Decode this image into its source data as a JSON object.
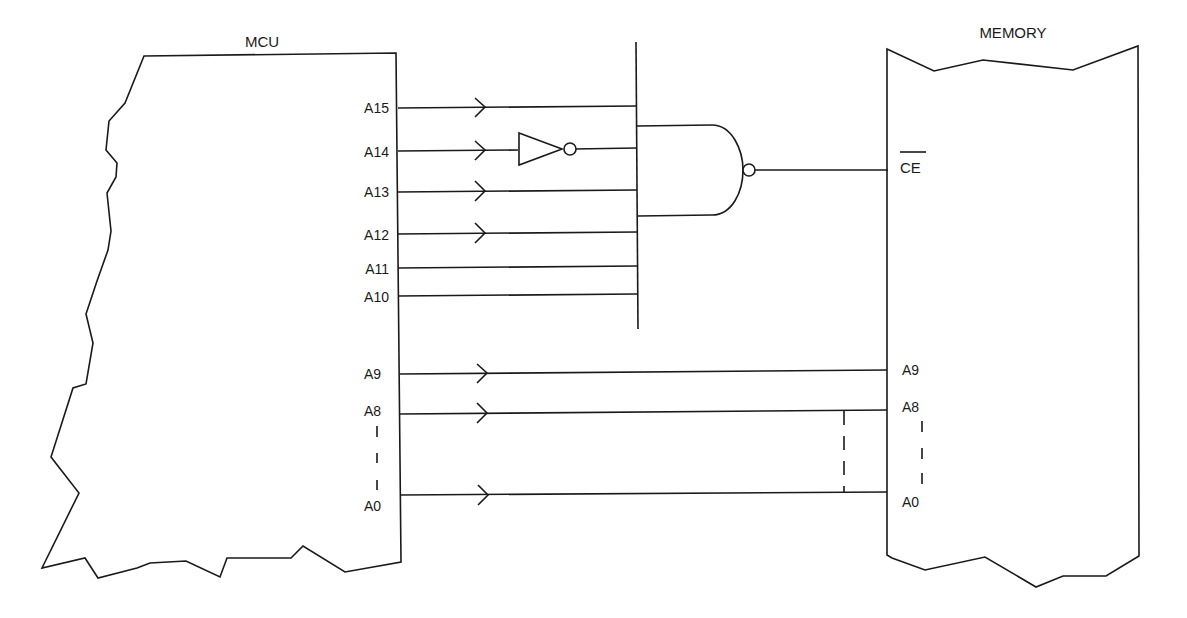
{
  "diagram": {
    "type": "address-decoding-schematic",
    "colors": {
      "line": "#1a1a1a",
      "background": "#ffffff"
    },
    "mcu": {
      "title": "MCU",
      "pins": [
        {
          "label": "A15",
          "y": 107,
          "arrow": true
        },
        {
          "label": "A14",
          "y": 151,
          "arrow": true,
          "inverted": true
        },
        {
          "label": "A13",
          "y": 191,
          "arrow": true
        },
        {
          "label": "A12",
          "y": 233,
          "arrow": true
        },
        {
          "label": "A11",
          "y": 267,
          "arrow": false
        },
        {
          "label": "A10",
          "y": 295,
          "arrow": false
        },
        {
          "label": "A9",
          "y": 373,
          "arrow": true
        },
        {
          "label": "A8",
          "y": 412,
          "arrow": true
        },
        {
          "label": "A0",
          "y": 495,
          "arrow": true
        }
      ],
      "ellipsis": "| | |"
    },
    "decoder": {
      "gate": "NAND",
      "inverter_input": "A14",
      "output_label": "CE",
      "output_active_low": true
    },
    "memory": {
      "title": "MEMORY",
      "pins": [
        {
          "label": "CE",
          "overbar": true,
          "y": 170
        },
        {
          "label": "A9",
          "y": 370
        },
        {
          "label": "A8",
          "y": 410
        },
        {
          "label": "A0",
          "y": 492
        }
      ]
    }
  }
}
